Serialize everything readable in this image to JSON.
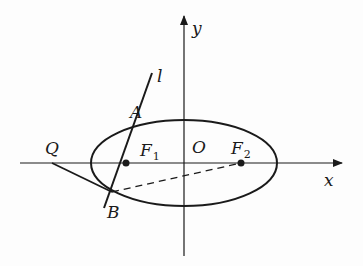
{
  "diagram": {
    "type": "ellipse-focal-chord",
    "colors": {
      "stroke": "#1a1a1a",
      "background": "#fdfdfd"
    },
    "axes": {
      "x_label": "x",
      "y_label": "y",
      "origin_label": "O"
    },
    "points": {
      "A": {
        "label": "A"
      },
      "B": {
        "label": "B"
      },
      "Q": {
        "label": "Q"
      },
      "F1": {
        "label": "F",
        "sub": "1"
      },
      "F2": {
        "label": "F",
        "sub": "2"
      }
    },
    "line_label": "l",
    "segments": [
      {
        "from": "Q",
        "to": "B",
        "style": "solid"
      },
      {
        "from": "B",
        "to": "F2",
        "style": "dashed"
      },
      {
        "name": "l",
        "through": [
          "A",
          "F1",
          "B"
        ],
        "style": "solid"
      }
    ]
  }
}
